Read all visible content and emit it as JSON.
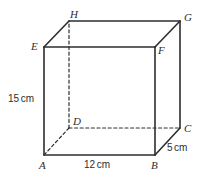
{
  "figure": {
    "type": "rectangular-prism",
    "background_color": "#ffffff",
    "line_color": "#2e2e2e",
    "solid_stroke_width": 1.6,
    "dashed_stroke_width": 1.2,
    "dash_pattern": "3,2.6"
  },
  "vertices": [
    {
      "id": "A",
      "label": "A",
      "x": 44,
      "y": 155,
      "label_x": 39,
      "label_y": 160,
      "hidden": false
    },
    {
      "id": "B",
      "label": "B",
      "x": 155,
      "y": 155,
      "label_x": 151,
      "label_y": 160,
      "hidden": false
    },
    {
      "id": "C",
      "label": "C",
      "x": 180,
      "y": 128,
      "label_x": 184,
      "label_y": 123,
      "hidden": false
    },
    {
      "id": "D",
      "label": "D",
      "x": 69,
      "y": 128,
      "label_x": 73,
      "label_y": 116,
      "hidden": true
    },
    {
      "id": "E",
      "label": "E",
      "x": 44,
      "y": 47,
      "label_x": 31,
      "label_y": 41,
      "hidden": false
    },
    {
      "id": "F",
      "label": "F",
      "x": 155,
      "y": 47,
      "label_x": 158,
      "label_y": 45,
      "hidden": false
    },
    {
      "id": "G",
      "label": "G",
      "x": 180,
      "y": 21,
      "label_x": 184,
      "label_y": 12,
      "hidden": false
    },
    {
      "id": "H",
      "label": "H",
      "x": 69,
      "y": 21,
      "label_x": 70,
      "label_y": 9,
      "hidden": false
    }
  ],
  "edges": {
    "solid": [
      {
        "name": "edge-A-B",
        "from": "A",
        "to": "B"
      },
      {
        "name": "edge-B-F",
        "from": "B",
        "to": "F"
      },
      {
        "name": "edge-F-E",
        "from": "F",
        "to": "E"
      },
      {
        "name": "edge-E-A",
        "from": "E",
        "to": "A"
      },
      {
        "name": "edge-E-H",
        "from": "E",
        "to": "H"
      },
      {
        "name": "edge-H-G",
        "from": "H",
        "to": "G"
      },
      {
        "name": "edge-G-F",
        "from": "G",
        "to": "F"
      },
      {
        "name": "edge-B-C",
        "from": "B",
        "to": "C"
      },
      {
        "name": "edge-C-G",
        "from": "C",
        "to": "G"
      }
    ],
    "dashed": [
      {
        "name": "edge-D-A",
        "from": "D",
        "to": "A"
      },
      {
        "name": "edge-D-C",
        "from": "D",
        "to": "C"
      },
      {
        "name": "edge-D-H",
        "from": "D",
        "to": "H"
      }
    ]
  },
  "dimensions": [
    {
      "id": "height",
      "value": "15",
      "unit": "cm",
      "text": "15 cm",
      "edge": "A-E",
      "label_x": 8,
      "label_y": 94
    },
    {
      "id": "width",
      "value": "12",
      "unit": "cm",
      "text": "12 cm",
      "edge": "A-B",
      "label_x": 84,
      "label_y": 160
    },
    {
      "id": "depth",
      "value": "5",
      "unit": "cm",
      "text": "5 cm",
      "edge": "B-C",
      "label_x": 167,
      "label_y": 143
    }
  ]
}
